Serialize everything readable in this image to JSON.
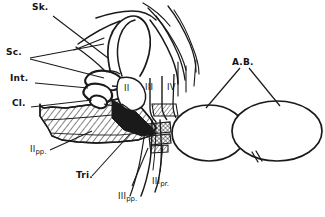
{
  "figure": {
    "kind": "anatomical-line-drawing",
    "background_color": "#ffffff",
    "ink_color": "#1a1a1a",
    "width": 325,
    "height": 217
  },
  "labels": {
    "sk": "Sk.",
    "sc": "Sc.",
    "int": "Int.",
    "cl": "Cl.",
    "ii_pp_main": "II",
    "ii_pp_sub": "pp.",
    "tri": "Tri.",
    "iii_pp_main": "III",
    "iii_pp_sub": "pp.",
    "iii_pr_main": "III",
    "iii_pr_sub": "pr.",
    "roman_ii": "II",
    "roman_iii": "III",
    "roman_iv": "IV",
    "ab": "A.B."
  },
  "structures": [
    {
      "name": "skeleton-outline",
      "label_key": "sk"
    },
    {
      "name": "scutum-region",
      "label_key": "sc"
    },
    {
      "name": "intersegmental-joint",
      "label_key": "int"
    },
    {
      "name": "clavus-region",
      "label_key": "cl"
    },
    {
      "name": "second-pleuropodite",
      "label_key": "ii_pp_main"
    },
    {
      "name": "trito-region",
      "label_key": "tri"
    },
    {
      "name": "third-pleuropodite",
      "label_key": "iii_pp_main"
    },
    {
      "name": "third-process",
      "label_key": "iii_pr_main"
    },
    {
      "name": "segment-two",
      "label_key": "roman_ii"
    },
    {
      "name": "segment-three",
      "label_key": "roman_iii"
    },
    {
      "name": "segment-four",
      "label_key": "roman_iv"
    },
    {
      "name": "abdominal-body",
      "label_key": "ab"
    }
  ]
}
